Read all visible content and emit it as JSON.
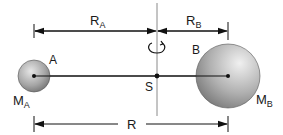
{
  "diagram": {
    "labels": {
      "r_a": "R",
      "r_a_sub": "A",
      "r_b": "R",
      "r_b_sub": "B",
      "r_total": "R",
      "point_a": "A",
      "point_b": "B",
      "center": "S",
      "mass_a": "M",
      "mass_a_sub": "A",
      "mass_b": "M",
      "mass_b_sub": "B"
    },
    "colors": {
      "line": "#111111",
      "axis": "#8a8a8a",
      "sphere_light": "#e8e8e8",
      "sphere_dark": "#6e6e6e"
    },
    "geometry": {
      "body_a": {
        "cx": 34,
        "cy": 76,
        "r": 16
      },
      "body_b": {
        "cx": 228,
        "cy": 76,
        "r": 32
      },
      "center_s": {
        "cx": 157,
        "cy": 76
      },
      "top_dim_y": 31,
      "bottom_dim_y": 124
    }
  }
}
